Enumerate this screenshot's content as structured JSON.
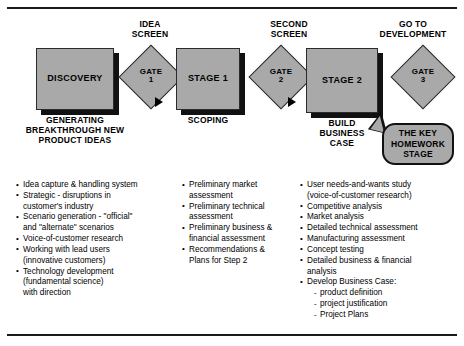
{
  "diagram": {
    "colors": {
      "box_fill": "#a9a9a9",
      "box_border": "#2b2b2b",
      "shadow": "#111111",
      "text": "#000000"
    },
    "screen_captions": [
      {
        "id": "idea-screen",
        "text": "IDEA\nSCREEN"
      },
      {
        "id": "second-screen",
        "text": "SECOND\nSCREEN"
      },
      {
        "id": "go-to-development",
        "text": "GO TO\nDEVELOPMENT"
      }
    ],
    "stages": [
      {
        "id": "discovery",
        "label": "DISCOVERY",
        "caption": "GENERATING\nBREAKTHROUGH NEW\nPRODUCT IDEAS"
      },
      {
        "id": "stage-1",
        "label": "STAGE 1",
        "caption": "SCOPING"
      },
      {
        "id": "stage-2",
        "label": "STAGE 2",
        "caption": "BUILD\nBUSINESS\nCASE"
      }
    ],
    "gates": [
      {
        "id": "gate-1",
        "line1": "GATE",
        "line2": "1"
      },
      {
        "id": "gate-2",
        "line1": "GATE",
        "line2": "2"
      },
      {
        "id": "gate-3",
        "line1": "GATE",
        "line2": "3"
      }
    ],
    "callout": {
      "id": "key-homework-stage",
      "text": "THE KEY\nHOMEWORK\nSTAGE"
    },
    "bullet_columns": [
      {
        "id": "discovery-activities",
        "items": [
          {
            "text": "Idea capture & handling system",
            "sub": false
          },
          {
            "text": "Strategic - disruptions in\ncustomer's industry",
            "sub": false
          },
          {
            "text": "Scenario generation - \"official\"\nand \"alternate\" scenarios",
            "sub": false
          },
          {
            "text": "Voice-of-customer research",
            "sub": false
          },
          {
            "text": "Working with lead users\n(innovative customers)",
            "sub": false
          },
          {
            "text": "Technology development\n(fundamental science)\nwith direction",
            "sub": false
          }
        ]
      },
      {
        "id": "stage-1-activities",
        "items": [
          {
            "text": "Preliminary market\nassessment",
            "sub": false
          },
          {
            "text": "Preliminary technical\nassessment",
            "sub": false
          },
          {
            "text": "Preliminary business &\nfinancial assessment",
            "sub": false
          },
          {
            "text": "Recommendations &\nPlans for Step 2",
            "sub": false
          }
        ]
      },
      {
        "id": "stage-2-activities",
        "items": [
          {
            "text": "User needs-and-wants study\n(voice-of-customer research)",
            "sub": false
          },
          {
            "text": "Competitive analysis",
            "sub": false
          },
          {
            "text": "Market analysis",
            "sub": false
          },
          {
            "text": "Detailed technical assessment",
            "sub": false
          },
          {
            "text": "Manufacturing assessment",
            "sub": false
          },
          {
            "text": "Concept testing",
            "sub": false
          },
          {
            "text": "Detailed business & financial\nanalysis",
            "sub": false
          },
          {
            "text": "Develop Business Case:",
            "sub": false
          },
          {
            "text": "product definition",
            "sub": true
          },
          {
            "text": "project justification",
            "sub": true
          },
          {
            "text": "Project Plans",
            "sub": true
          }
        ]
      }
    ]
  }
}
